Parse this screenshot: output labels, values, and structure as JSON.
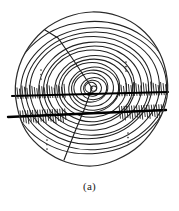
{
  "figure": {
    "caption": "(a)",
    "colors": {
      "ink": "#1a1a1a",
      "background": "#ffffff",
      "ring_stroke": "#222222",
      "bark_outline": "#2b2b2b",
      "scan_line": "#000000"
    }
  },
  "chart_data": {
    "type": "scatter",
    "title": "(a)",
    "xlabel": "",
    "ylabel": "",
    "grid": false,
    "legend": null,
    "disc": {
      "center_x": 92,
      "center_y": 88,
      "radius_x": 76,
      "radius_y": 74,
      "outline_points": [
        [
          92,
          12
        ],
        [
          118,
          16
        ],
        [
          140,
          28
        ],
        [
          157,
          48
        ],
        [
          166,
          72
        ],
        [
          167,
          97
        ],
        [
          158,
          122
        ],
        [
          140,
          145
        ],
        [
          116,
          160
        ],
        [
          92,
          166
        ],
        [
          66,
          162
        ],
        [
          44,
          150
        ],
        [
          26,
          131
        ],
        [
          17,
          106
        ],
        [
          16,
          80
        ],
        [
          25,
          53
        ],
        [
          44,
          30
        ],
        [
          67,
          17
        ]
      ]
    },
    "growth_rings": {
      "count": 17,
      "center": [
        92,
        88
      ],
      "radii_x": [
        3,
        6,
        9,
        13,
        17,
        21,
        25,
        29,
        34,
        39,
        44,
        49,
        55,
        61,
        67,
        73,
        79
      ],
      "radii_y": [
        2.6,
        5.2,
        8,
        11,
        14.5,
        18,
        21.5,
        25,
        29,
        33,
        37.5,
        42,
        46.5,
        51,
        56,
        61,
        66
      ],
      "rotation_deg": -6
    },
    "radial_cracks": [
      {
        "name": "upper-left-crack",
        "points": [
          [
            92,
            88
          ],
          [
            72,
            58
          ],
          [
            58,
            38
          ],
          [
            45,
            30
          ]
        ]
      },
      {
        "name": "lower-left-crack",
        "points": [
          [
            92,
            88
          ],
          [
            84,
            110
          ],
          [
            74,
            134
          ],
          [
            64,
            160
          ]
        ]
      }
    ],
    "scan_lines": [
      {
        "name": "upper-scan-line",
        "x1": 12,
        "y1": 96,
        "x2": 168,
        "y2": 92,
        "thickness": 2.1
      },
      {
        "name": "lower-scan-line",
        "x1": 8,
        "y1": 117,
        "x2": 166,
        "y2": 110,
        "thickness": 2.4
      }
    ],
    "ellipsis_marks": [
      {
        "name": "ellipsis-left",
        "x": 41,
        "y": 70,
        "dots": 3,
        "orientation": "vertical"
      },
      {
        "name": "ellipsis-upper-right",
        "x": 126,
        "y": 62,
        "dots": 3,
        "orientation": "vertical"
      },
      {
        "name": "ellipsis-lower-left",
        "x": 47,
        "y": 140,
        "dots": 3,
        "orientation": "vertical"
      },
      {
        "name": "ellipsis-lower-right",
        "x": 128,
        "y": 133,
        "dots": 3,
        "orientation": "vertical"
      }
    ],
    "hatch_band": {
      "name": "sawtooth-hatch-band",
      "y_top": 84,
      "y_bottom": 124,
      "tick_count": 64,
      "description": "dense short vertical tick marks along the horizontal scan band"
    }
  }
}
